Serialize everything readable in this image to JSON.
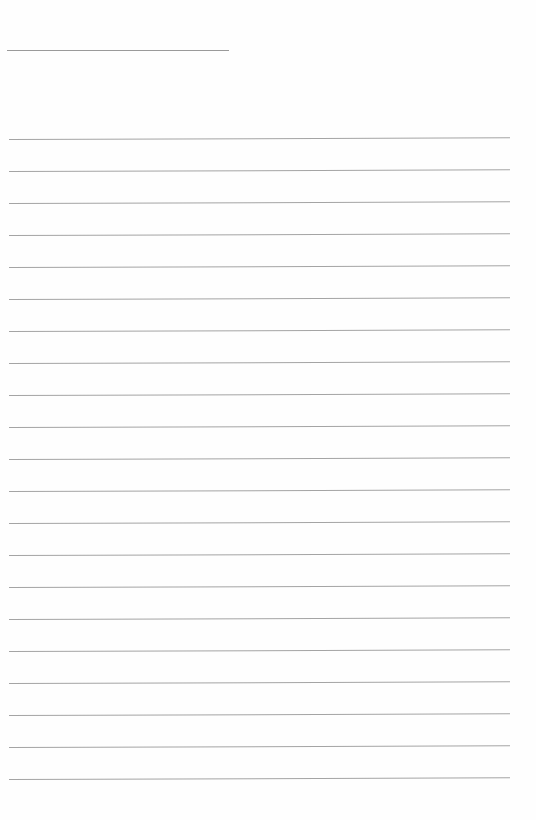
{
  "page": {
    "type": "lined-paper",
    "background_color": "#fefefe",
    "line_color": "#a4a4a4",
    "title_line": {
      "text": "",
      "x1": 7,
      "x2": 229,
      "y": 50
    },
    "ruled_lines": {
      "count": 21,
      "first_y": 139,
      "spacing": 32,
      "x_start": 9,
      "x_end": 510,
      "lines": [
        {
          "y": 139,
          "text": ""
        },
        {
          "y": 171,
          "text": ""
        },
        {
          "y": 203,
          "text": ""
        },
        {
          "y": 235,
          "text": ""
        },
        {
          "y": 267,
          "text": ""
        },
        {
          "y": 299,
          "text": ""
        },
        {
          "y": 331,
          "text": ""
        },
        {
          "y": 363,
          "text": ""
        },
        {
          "y": 395,
          "text": ""
        },
        {
          "y": 427,
          "text": ""
        },
        {
          "y": 459,
          "text": ""
        },
        {
          "y": 491,
          "text": ""
        },
        {
          "y": 523,
          "text": ""
        },
        {
          "y": 555,
          "text": ""
        },
        {
          "y": 587,
          "text": ""
        },
        {
          "y": 619,
          "text": ""
        },
        {
          "y": 651,
          "text": ""
        },
        {
          "y": 683,
          "text": ""
        },
        {
          "y": 715,
          "text": ""
        },
        {
          "y": 747,
          "text": ""
        },
        {
          "y": 779,
          "text": ""
        }
      ]
    }
  }
}
